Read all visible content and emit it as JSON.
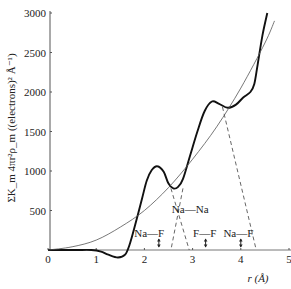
{
  "chart_data": {
    "type": "line",
    "title": "",
    "xlabel": "r (Å)",
    "ylabel": "ΣK_m 4πr²ρ_m ((electrons)² Å⁻¹)",
    "xlim": [
      0,
      5
    ],
    "ylim": [
      0,
      3000
    ],
    "x_ticks": [
      0,
      1,
      2,
      3,
      4,
      5
    ],
    "y_ticks": [
      500,
      1000,
      1500,
      2000,
      2500,
      3000
    ],
    "grid": false,
    "legend": null,
    "series": [
      {
        "name": "radial distribution function (experimental)",
        "style": "thick-solid",
        "x": [
          0,
          0.3,
          0.6,
          0.9,
          1.1,
          1.25,
          1.45,
          1.6,
          1.7,
          1.8,
          1.95,
          2.05,
          2.15,
          2.27,
          2.4,
          2.5,
          2.6,
          2.7,
          2.8,
          2.95,
          3.1,
          3.25,
          3.4,
          3.55,
          3.73,
          3.9,
          4.05,
          4.2,
          4.28,
          4.35,
          4.45,
          4.55
        ],
        "y": [
          0,
          0,
          0,
          0,
          -20,
          -60,
          -95,
          -60,
          80,
          300,
          650,
          880,
          1010,
          1060,
          990,
          840,
          780,
          800,
          900,
          1200,
          1500,
          1760,
          1880,
          1850,
          1800,
          1840,
          1930,
          2000,
          2100,
          2350,
          2720,
          3000
        ]
      },
      {
        "name": "average density curve 4πr²ρ0",
        "style": "thin-solid",
        "x": [
          0,
          0.5,
          1.0,
          1.5,
          2.0,
          2.5,
          3.0,
          3.5,
          4.0,
          4.5,
          4.7
        ],
        "y": [
          0,
          40,
          125,
          290,
          500,
          790,
          1150,
          1560,
          2050,
          2620,
          2900
        ]
      }
    ],
    "dashed_lines": [
      {
        "from": [
          2.55,
          780
        ],
        "to": [
          2.93,
          0
        ]
      },
      {
        "from": [
          2.8,
          780
        ],
        "to": [
          2.55,
          0
        ]
      },
      {
        "from": [
          3.62,
          1810
        ],
        "to": [
          4.32,
          0
        ]
      }
    ],
    "annotations": [
      {
        "text": "Na—F",
        "x": 2.1,
        "y": 170,
        "arrow_x": 2.3
      },
      {
        "text": "Na—Na",
        "x": 2.95,
        "y": 470,
        "arrow_x": null
      },
      {
        "text": "F—F",
        "x": 3.25,
        "y": 170,
        "arrow_x": 3.27
      },
      {
        "text": "Na—F",
        "x": 3.95,
        "y": 170,
        "arrow_x": 4.0
      }
    ]
  },
  "axes": {
    "x_tick_labels": [
      "0",
      "1",
      "2",
      "3",
      "4",
      "5"
    ],
    "y_tick_labels": [
      "500",
      "1000",
      "1500",
      "2000",
      "2500",
      "3000"
    ],
    "xlabel": "r (Å)",
    "ylabel": "ΣK_m 4πr²ρ_m ((electrons)² Å⁻¹)"
  },
  "annotations": {
    "nafe_1": "Na—F",
    "nana": "Na—Na",
    "ff": "F—F",
    "nafe_2": "Na—F"
  }
}
